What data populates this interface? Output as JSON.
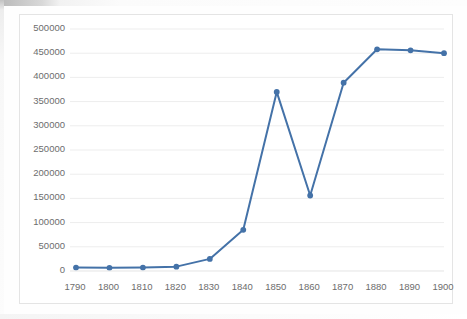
{
  "chart_data": {
    "type": "line",
    "title": "",
    "subtitle": "",
    "xlabel": "",
    "ylabel": "",
    "categories": [
      1790,
      1800,
      1810,
      1820,
      1830,
      1840,
      1850,
      1860,
      1870,
      1880,
      1890,
      1900
    ],
    "x_tick_labels": [
      "1790",
      "1800",
      "1810",
      "1820",
      "1830",
      "1840",
      "1850",
      "1860",
      "1870",
      "1880",
      "1890",
      "1900"
    ],
    "values": [
      7000,
      6500,
      7000,
      9000,
      25000,
      85000,
      370000,
      156000,
      389000,
      458000,
      456000,
      450000
    ],
    "series": [
      {
        "name": "",
        "values": [
          7000,
          6500,
          7000,
          9000,
          25000,
          85000,
          370000,
          156000,
          389000,
          458000,
          456000,
          450000
        ]
      }
    ],
    "ylim": [
      0,
      500000
    ],
    "y_ticks": [
      0,
      50000,
      100000,
      150000,
      200000,
      250000,
      300000,
      350000,
      400000,
      450000,
      500000
    ],
    "y_tick_labels": [
      "0",
      "50000",
      "100000",
      "150000",
      "200000",
      "250000",
      "300000",
      "350000",
      "400000",
      "450000",
      "500000"
    ],
    "grid": {
      "horizontal": true,
      "vertical": false
    },
    "legend": {
      "visible": false,
      "position": "none"
    },
    "markers": {
      "visible": true,
      "shape": "circle"
    },
    "colors": {
      "series_line": "#4472a8",
      "marker": "#4472a8",
      "gridline": "#ededed",
      "plot_border": "#e4e4e4",
      "tick_text": "#6d6d6d",
      "plot_background": "#ffffff"
    },
    "line_width_px": 2
  }
}
